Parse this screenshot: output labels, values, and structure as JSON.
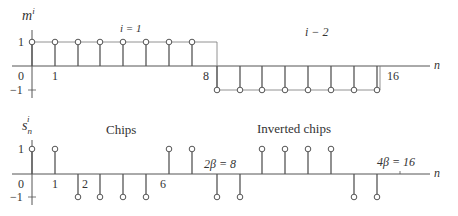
{
  "diagram": {
    "top_plot": {
      "y_label": "m",
      "y_label_sub": "i",
      "y_label_sup": "i",
      "x_label": "n",
      "annotations": {
        "segment1": "i = 1",
        "segment2": "i − 2"
      },
      "tick_labels": {
        "origin": "0",
        "one": "1",
        "eight": "8",
        "sixteen": "16",
        "y_plus": "1",
        "y_minus": "−1"
      },
      "values": [
        1,
        1,
        1,
        1,
        1,
        1,
        1,
        1,
        -1,
        -1,
        -1,
        -1,
        -1,
        -1,
        -1,
        -1
      ]
    },
    "bottom_plot": {
      "y_label": "s",
      "y_label_sub": "n",
      "y_label_sup": "i",
      "x_label": "n",
      "annotations": {
        "chips": "Chips",
        "inverted": "Inverted chips"
      },
      "tick_labels": {
        "origin": "0",
        "one": "1",
        "two": "2",
        "six": "6",
        "two_beta": "2β = 8",
        "four_beta": "4β = 16",
        "y_plus": "1",
        "y_minus": "−1"
      },
      "values": [
        1,
        1,
        -1,
        -1,
        -1,
        -1,
        1,
        1,
        -1,
        -1,
        1,
        1,
        1,
        1,
        -1,
        -1
      ]
    },
    "colors": {
      "stroke": "#555555",
      "text": "#333333"
    }
  }
}
